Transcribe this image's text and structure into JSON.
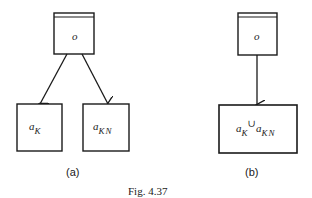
{
  "figure": {
    "caption": "Fig. 4.37"
  },
  "panels": [
    {
      "label": "(a)",
      "root": {
        "text": "o",
        "style": "double-top-border"
      },
      "children": [
        {
          "base": "a",
          "subscript": "K"
        },
        {
          "base": "a",
          "subscript": "KN"
        }
      ],
      "edges": [
        {
          "from": "o",
          "to": "a_K"
        },
        {
          "from": "o",
          "to": "a_KN"
        }
      ]
    },
    {
      "label": "(b)",
      "root": {
        "text": "o",
        "style": "double-top-border"
      },
      "children": [
        {
          "base1": "a",
          "sub1": "K",
          "operator": "∪",
          "base2": "a",
          "sub2": "KN"
        }
      ],
      "edges": [
        {
          "from": "o",
          "to": "a_K ∪ a_KN"
        }
      ]
    }
  ],
  "colors": {
    "stroke": "#1a1a1a",
    "background": "#ffffff"
  }
}
